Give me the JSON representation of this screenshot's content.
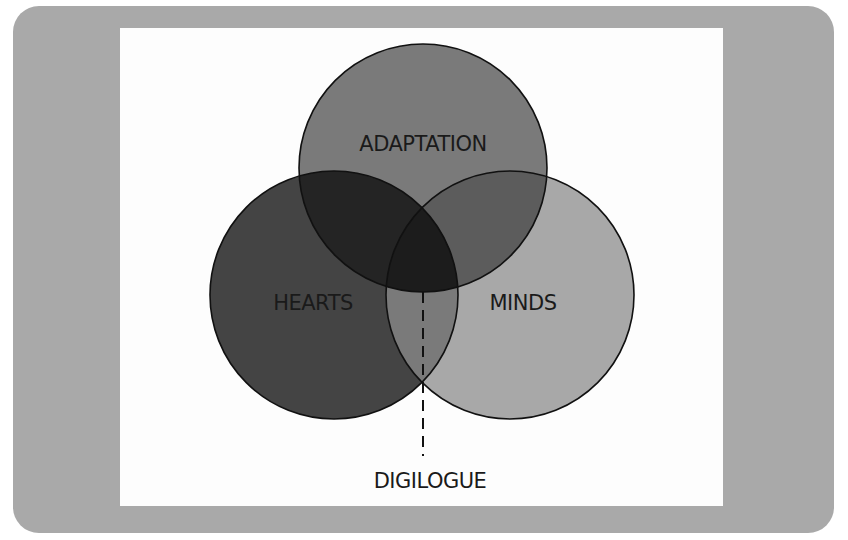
{
  "diagram": {
    "type": "venn",
    "circles": [
      {
        "label": "ADAPTATION",
        "fill": "#7a7a7a"
      },
      {
        "label": "HEARTS",
        "fill": "#444444"
      },
      {
        "label": "MINDS",
        "fill": "#a8a8a8"
      }
    ],
    "intersections": {
      "hearts_adaptation": "#242424",
      "minds_adaptation": "#5c5c5c",
      "hearts_minds": "#7a7a7a",
      "all_three": "#1c1c1c"
    },
    "callout": {
      "label": "DIGILOGUE"
    },
    "colors": {
      "frame": "#a9a9a9",
      "panel": "#fdfdfd",
      "stroke": "#111111"
    }
  }
}
